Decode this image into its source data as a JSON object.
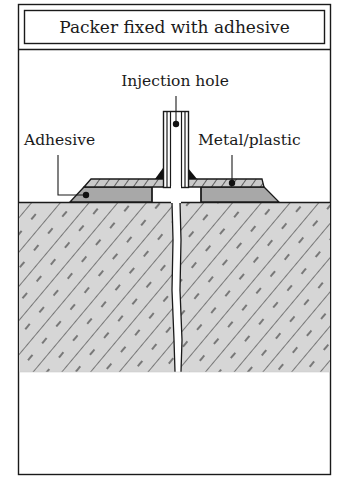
{
  "diagram": {
    "title": "Packer fixed with adhesive",
    "labels": {
      "injection_hole": "Injection hole",
      "adhesive": "Adhesive",
      "metal_plastic": "Metal/plastic"
    },
    "colors": {
      "line": "#1a1a1a",
      "adhesive_fill": "#a9a9a9",
      "concrete_fill": "#d4d4d4",
      "metal_fill": "#c8c8c8",
      "background": "#ffffff"
    }
  }
}
